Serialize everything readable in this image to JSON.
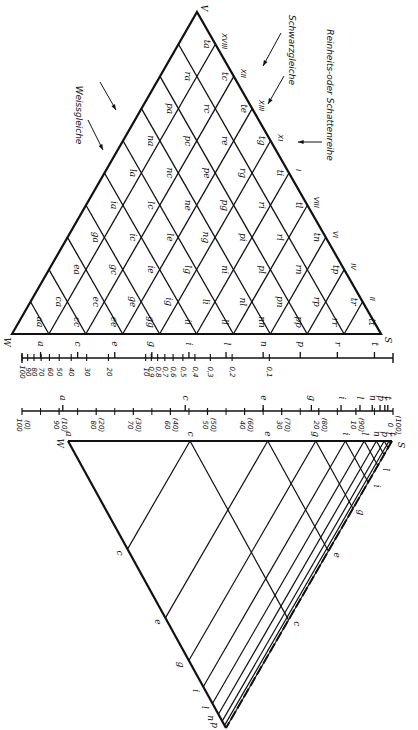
{
  "figure": {
    "orientation": "rotated 90° clockwise (text reads top-to-bottom)",
    "top_triangle": {
      "vertices": {
        "white": "W",
        "full_color": "V",
        "black": "S"
      },
      "scale_letters": [
        "a",
        "c",
        "e",
        "g",
        "i",
        "l",
        "n",
        "p",
        "r",
        "t"
      ],
      "cells": [
        [
          "aa"
        ],
        [
          "ca",
          "cc"
        ],
        [
          "ea",
          "ec",
          "ee"
        ],
        [
          "ga",
          "gc",
          "ge",
          "gg"
        ],
        [
          "ia",
          "ic",
          "ie",
          "ig",
          "ii"
        ],
        [
          "la",
          "lc",
          "le",
          "lg",
          "li",
          "ll"
        ],
        [
          "na",
          "nc",
          "ne",
          "ng",
          "ni",
          "nl",
          "nn"
        ],
        [
          "pa",
          "pc",
          "pe",
          "pg",
          "pi",
          "pl",
          "pn",
          "pp"
        ],
        [
          "ra",
          "rc",
          "re",
          "rg",
          "ri",
          "rl",
          "rn",
          "rp",
          "rr"
        ],
        [
          "ta",
          "tc",
          "te",
          "tg",
          "ti",
          "tl",
          "tn",
          "tp",
          "tr",
          "tt"
        ]
      ],
      "annotations": {
        "white_equal": "Weissgleiche",
        "black_equal": "Schwarzgleiche",
        "shadow_series": "Reinheits-oder Schattenreihe"
      },
      "edge_numerals": [
        "XVIII",
        "XII",
        "XIII",
        "XI",
        "I",
        "VIII",
        "VI",
        "IV",
        "II"
      ]
    },
    "scale_top": {
      "letters": [
        "a",
        "c",
        "e",
        "g",
        "i",
        "l",
        "n",
        "p",
        "r",
        "t"
      ],
      "values": [
        "100",
        "90",
        "80",
        "70",
        "60",
        "50",
        "40",
        "30",
        "20",
        "10",
        "0,9",
        "0,8",
        "0,7",
        "0,6",
        "0,5",
        "0,4",
        "0,3",
        "0,2",
        "0,1"
      ]
    },
    "scale_bottom": {
      "letters": [
        "a",
        "c",
        "e",
        "g",
        "i",
        "l",
        "n",
        "p",
        "r",
        "t"
      ],
      "values": [
        {
          "main": "100",
          "sub": "(0)"
        },
        {
          "main": "90",
          "sub": "(10)"
        },
        {
          "main": "80",
          "sub": "(20)"
        },
        {
          "main": "70",
          "sub": "(30)"
        },
        {
          "main": "60",
          "sub": "(40)"
        },
        {
          "main": "50",
          "sub": "(50)"
        },
        {
          "main": "40",
          "sub": "(60)"
        },
        {
          "main": "30",
          "sub": "(70)"
        },
        {
          "main": "20",
          "sub": "(80)"
        },
        {
          "main": "10",
          "sub": "(90)"
        },
        {
          "main": "0",
          "sub": "(100)"
        }
      ]
    },
    "bottom_triangle": {
      "vertices": {
        "white": "W",
        "black": "S"
      },
      "top_letters": [
        "a",
        "c",
        "e",
        "g",
        "i",
        "l",
        "n",
        "p",
        "r",
        "t"
      ],
      "left_edge_letters": [
        "c",
        "e",
        "g",
        "i",
        "l",
        "n",
        "p"
      ],
      "right_edge_letters": [
        "c",
        "e",
        "g",
        "i",
        "l"
      ]
    }
  }
}
